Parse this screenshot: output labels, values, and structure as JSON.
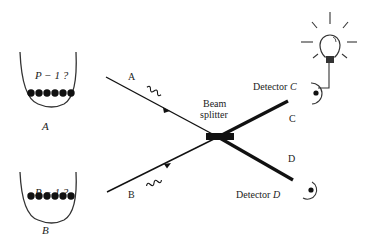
{
  "diagram": {
    "sources": [
      {
        "id": "A",
        "well_label": "P − 1 ?",
        "name_label": "A",
        "beam_label": "A",
        "atom_count": 6
      },
      {
        "id": "B",
        "well_label": "P − 1 ?",
        "name_label": "B",
        "beam_label": "B",
        "atom_count": 6
      }
    ],
    "beam_splitter": {
      "label_line1": "Beam",
      "label_line2": "splitter"
    },
    "outputs": [
      {
        "id": "C",
        "beam_label": "C",
        "detector_label": "Detector",
        "detector_id": "C"
      },
      {
        "id": "D",
        "beam_label": "D",
        "detector_label": "Detector",
        "detector_id": "D"
      }
    ],
    "indicator": {
      "icon": "light-bulb-icon",
      "connected_to": "Detector C"
    },
    "colors": {
      "ink": "#111111",
      "background": "#ffffff"
    }
  }
}
